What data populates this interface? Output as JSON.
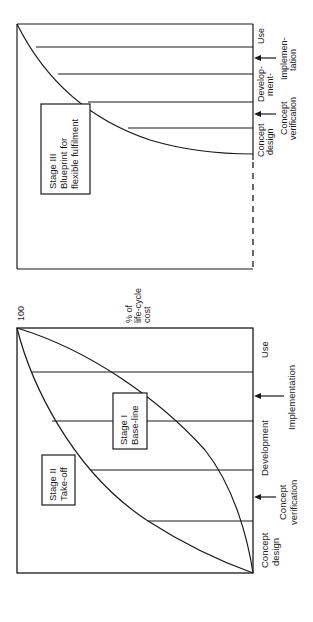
{
  "figure": {
    "top_panel": {
      "stage_box": [
        "Stage III",
        "Blueprint for",
        "flexible fulfilment"
      ],
      "phase_labels": [
        {
          "id": "concept-design",
          "lines": [
            "Concept",
            "design"
          ]
        },
        {
          "id": "development",
          "lines": [
            "Develop-",
            "ment-"
          ]
        },
        {
          "id": "use",
          "lines": [
            "Use"
          ]
        }
      ],
      "milestone_labels": [
        {
          "id": "concept-verification",
          "lines": [
            "Concept",
            "verification"
          ]
        },
        {
          "id": "implementation",
          "lines": [
            "Implemen-",
            "tation"
          ]
        }
      ]
    },
    "bottom_panel": {
      "y_max_label": "100",
      "y_axis_label": [
        "% of",
        "life-cycle",
        "cost"
      ],
      "stage_boxes": [
        {
          "id": "stage-1",
          "lines": [
            "Stage I",
            "Base-line"
          ]
        },
        {
          "id": "stage-2",
          "lines": [
            "Stage II",
            "Take-off"
          ]
        }
      ],
      "phase_labels": [
        {
          "id": "concept-design",
          "lines": [
            "Concept",
            "design"
          ]
        },
        {
          "id": "development",
          "lines": [
            "Development"
          ]
        },
        {
          "id": "use",
          "lines": [
            "Use"
          ]
        }
      ],
      "milestone_labels": [
        {
          "id": "concept-verification",
          "lines": [
            "Concept",
            "verification"
          ]
        },
        {
          "id": "implementation",
          "lines": [
            "Implementation"
          ]
        }
      ]
    }
  }
}
